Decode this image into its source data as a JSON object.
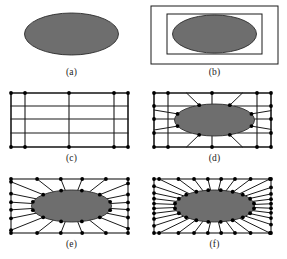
{
  "figure": {
    "background_color": "#ffffff",
    "panel_count": 6
  },
  "style": {
    "ellipse_fill": "#6e6e6e",
    "ellipse_stroke": "#2b2b2b",
    "line_color": "#1a1a1a",
    "node_color": "#000000",
    "caption_color": "#1a1a1a",
    "grid_line_width": 1.1,
    "mesh_line_width": 1.0,
    "node_radius": 1.9
  },
  "panels": [
    {
      "id": "a",
      "caption": "(a)",
      "description": "Solid ellipse alone on blank background",
      "has_outer_rect": false,
      "has_inner_rect": false,
      "has_grid": false,
      "has_radial_mesh": false,
      "has_nodes": false,
      "ellipse": {
        "cx": 71.5,
        "cy": 32,
        "rx": 47,
        "ry": 21
      }
    },
    {
      "id": "b",
      "caption": "(b)",
      "description": "Ellipse with bounding box and outer domain rectangle",
      "has_outer_rect": true,
      "has_inner_rect": true,
      "has_grid": false,
      "has_radial_mesh": false,
      "has_nodes": false,
      "ellipse": {
        "cx": 71.5,
        "cy": 32,
        "rx": 42,
        "ry": 19
      },
      "outer_rect": {
        "x": 8,
        "y": 4,
        "w": 127,
        "h": 58
      },
      "inner_rect": {
        "x": 24,
        "y": 12,
        "w": 95,
        "h": 40
      }
    },
    {
      "id": "c",
      "caption": "(c)",
      "description": "Structured background grid with corner nodes, no inclusion",
      "has_outer_rect": true,
      "has_inner_rect": false,
      "has_grid": true,
      "has_radial_mesh": false,
      "has_nodes": true,
      "outer_rect": {
        "x": 11,
        "y": 5,
        "w": 117,
        "h": 54
      },
      "grid_vertical_x": [
        11,
        25,
        69,
        114,
        128
      ],
      "grid_horizontal_y": [
        5,
        18,
        31,
        45,
        59
      ],
      "corner_nodes": [
        {
          "x": 11,
          "y": 5
        },
        {
          "x": 25,
          "y": 5
        },
        {
          "x": 69,
          "y": 5
        },
        {
          "x": 114,
          "y": 5
        },
        {
          "x": 128,
          "y": 5
        },
        {
          "x": 11,
          "y": 59
        },
        {
          "x": 25,
          "y": 59
        },
        {
          "x": 69,
          "y": 59
        },
        {
          "x": 114,
          "y": 59
        },
        {
          "x": 128,
          "y": 59
        }
      ]
    },
    {
      "id": "d",
      "caption": "(d)",
      "description": "Grid deformed to conform to the ellipse boundary",
      "has_outer_rect": true,
      "has_inner_rect": false,
      "has_grid": true,
      "has_radial_mesh": true,
      "has_nodes": true,
      "ellipse": {
        "cx": 71.5,
        "cy": 32,
        "rx": 40,
        "ry": 16
      },
      "outer_rect": {
        "x": 11,
        "y": 5,
        "w": 117,
        "h": 54
      },
      "grid_vertical_x": [
        11,
        25,
        69,
        114,
        128
      ],
      "grid_horizontal_y": [
        5,
        18,
        31,
        45,
        59
      ],
      "boundary_node_count": 8,
      "corner_nodes": [
        {
          "x": 11,
          "y": 5
        },
        {
          "x": 25,
          "y": 5
        },
        {
          "x": 69,
          "y": 5
        },
        {
          "x": 114,
          "y": 5
        },
        {
          "x": 128,
          "y": 5
        },
        {
          "x": 11,
          "y": 59
        },
        {
          "x": 25,
          "y": 59
        },
        {
          "x": 69,
          "y": 59
        },
        {
          "x": 114,
          "y": 59
        },
        {
          "x": 128,
          "y": 59
        },
        {
          "x": 11,
          "y": 18
        },
        {
          "x": 11,
          "y": 31
        },
        {
          "x": 11,
          "y": 45
        },
        {
          "x": 128,
          "y": 18
        },
        {
          "x": 128,
          "y": 31
        },
        {
          "x": 128,
          "y": 45
        }
      ]
    },
    {
      "id": "e",
      "caption": "(e)",
      "description": "Coarse radial mesh connecting ellipse boundary to outer rectangle",
      "has_outer_rect": true,
      "has_inner_rect": false,
      "has_grid": false,
      "has_radial_mesh": true,
      "has_nodes": true,
      "ellipse": {
        "cx": 71.5,
        "cy": 32,
        "rx": 40,
        "ry": 16
      },
      "outer_rect": {
        "x": 11,
        "y": 5,
        "w": 117,
        "h": 54
      },
      "radial_spoke_count": 20,
      "boundary_node_count": 12,
      "outer_node_count": 16
    },
    {
      "id": "f",
      "caption": "(f)",
      "description": "Refined radial mesh with increased node density",
      "has_outer_rect": true,
      "has_inner_rect": false,
      "has_grid": false,
      "has_radial_mesh": true,
      "has_nodes": true,
      "ellipse": {
        "cx": 71.5,
        "cy": 32,
        "rx": 40,
        "ry": 16
      },
      "outer_rect": {
        "x": 11,
        "y": 5,
        "w": 117,
        "h": 54
      },
      "radial_spoke_count": 32,
      "boundary_node_count": 20,
      "outer_node_count": 28
    }
  ]
}
